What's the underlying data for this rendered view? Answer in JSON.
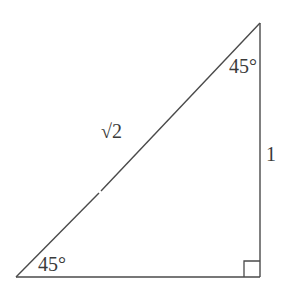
{
  "diagram": {
    "type": "right-triangle",
    "stroke_color": "#4a4a4a",
    "vertices": {
      "top": [
        260,
        23
      ],
      "bottom_left": [
        16,
        277
      ],
      "bottom_right": [
        260,
        277
      ]
    },
    "labels": {
      "top_angle": "45°",
      "bottom_left_angle": "45°",
      "vertical_side": "1",
      "hypotenuse": "√2"
    },
    "right_angle_marker": {
      "corner": "bottom_right",
      "size": 16
    }
  }
}
